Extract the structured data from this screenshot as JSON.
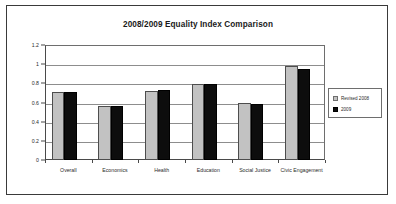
{
  "frame": {
    "label": "chart-frame"
  },
  "legend": {
    "position": "right",
    "entries": [
      {
        "label": "Revised 2008",
        "color": "#c2c2c2"
      },
      {
        "label": "2009",
        "color": "#0d0d0d"
      }
    ]
  },
  "chart_data": {
    "type": "bar",
    "title": "2008/2009 Equality Index Comparison",
    "xlabel": "",
    "ylabel": "",
    "ylim": [
      0,
      1.2
    ],
    "yticks": [
      0,
      0.2,
      0.4,
      0.6,
      0.8,
      1,
      1.2
    ],
    "ytick_labels": [
      "0",
      "0.2",
      "0.4",
      "0.6",
      "0.8",
      "1",
      "1.2"
    ],
    "grid": true,
    "legend_position": "right",
    "categories": [
      "Overall",
      "Economics",
      "Health",
      "Education",
      "Social Justice",
      "Civic Engagement"
    ],
    "series": [
      {
        "name": "Revised 2008",
        "color": "#c2c2c2",
        "values": [
          0.71,
          0.56,
          0.72,
          0.79,
          0.6,
          0.98
        ]
      },
      {
        "name": "2009",
        "color": "#0d0d0d",
        "values": [
          0.71,
          0.56,
          0.73,
          0.79,
          0.58,
          0.95
        ]
      }
    ]
  }
}
